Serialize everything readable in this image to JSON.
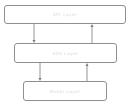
{
  "diagram": {
    "layers": [
      {
        "id": "top",
        "label": "API Layer"
      },
      {
        "id": "middle",
        "label": "SDK Layer"
      },
      {
        "id": "bottom",
        "label": "Model Layer"
      }
    ],
    "colors": {
      "border": "#8f8f8f",
      "arrow": "#7a7a7a",
      "text": "#d8d8d8"
    }
  }
}
